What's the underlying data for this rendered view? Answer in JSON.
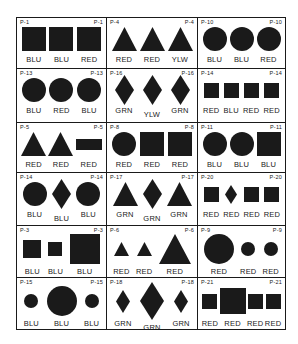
{
  "cells": [
    {
      "id": "P-1",
      "items": [
        {
          "shape": "square",
          "size": "l",
          "color": "BLU"
        },
        {
          "shape": "square",
          "size": "l",
          "color": "BLU"
        },
        {
          "shape": "square",
          "size": "l",
          "color": "RED"
        }
      ]
    },
    {
      "id": "P-4",
      "items": [
        {
          "shape": "triangle",
          "size": "l",
          "color": "RED"
        },
        {
          "shape": "triangle",
          "size": "l",
          "color": "RED"
        },
        {
          "shape": "triangle",
          "size": "l",
          "color": "YLW"
        }
      ]
    },
    {
      "id": "P-10",
      "items": [
        {
          "shape": "circle",
          "size": "l",
          "color": "BLU"
        },
        {
          "shape": "circle",
          "size": "l",
          "color": "BLU"
        },
        {
          "shape": "circle",
          "size": "l",
          "color": "RED"
        }
      ]
    },
    {
      "id": "P-13",
      "items": [
        {
          "shape": "circle",
          "size": "l",
          "color": "BLU"
        },
        {
          "shape": "circle",
          "size": "l",
          "color": "RED"
        },
        {
          "shape": "circle",
          "size": "l",
          "color": "BLU"
        }
      ]
    },
    {
      "id": "P-16",
      "items": [
        {
          "shape": "diamond",
          "size": "l",
          "color": "GRN"
        },
        {
          "shape": "diamond",
          "size": "l",
          "color": "YLW"
        },
        {
          "shape": "diamond",
          "size": "l",
          "color": "GRN"
        }
      ]
    },
    {
      "id": "P-14",
      "items": [
        {
          "shape": "square",
          "size": "s",
          "color": "RED"
        },
        {
          "shape": "square",
          "size": "s",
          "color": "BLU"
        },
        {
          "shape": "square",
          "size": "s",
          "color": "RED"
        },
        {
          "shape": "square",
          "size": "s",
          "color": "RED"
        }
      ]
    },
    {
      "id": "P-5",
      "items": [
        {
          "shape": "triangle",
          "size": "l",
          "color": "RED"
        },
        {
          "shape": "triangle",
          "size": "l",
          "color": "RED"
        },
        {
          "shape": "rectangle",
          "size": "l",
          "color": "RED"
        }
      ]
    },
    {
      "id": "P-8",
      "items": [
        {
          "shape": "circle",
          "size": "l",
          "color": "RED"
        },
        {
          "shape": "square",
          "size": "l",
          "color": "RED"
        },
        {
          "shape": "square",
          "size": "l",
          "color": "RED"
        }
      ]
    },
    {
      "id": "P-11",
      "items": [
        {
          "shape": "circle",
          "size": "l",
          "color": "BLU"
        },
        {
          "shape": "circle",
          "size": "l",
          "color": "BLU"
        },
        {
          "shape": "square",
          "size": "l",
          "color": "BLU"
        }
      ]
    },
    {
      "id": "P-14",
      "items": [
        {
          "shape": "circle",
          "size": "l",
          "color": "BLU"
        },
        {
          "shape": "diamond",
          "size": "l",
          "color": "BLU"
        },
        {
          "shape": "circle",
          "size": "l",
          "color": "BLU"
        }
      ]
    },
    {
      "id": "P-17",
      "items": [
        {
          "shape": "triangle",
          "size": "l",
          "color": "GRN"
        },
        {
          "shape": "diamond",
          "size": "l",
          "color": "GRN"
        },
        {
          "shape": "triangle",
          "size": "l",
          "color": "GRN"
        }
      ]
    },
    {
      "id": "P-20",
      "items": [
        {
          "shape": "square",
          "size": "s",
          "color": "RED"
        },
        {
          "shape": "diamond",
          "size": "s",
          "color": "RED"
        },
        {
          "shape": "square",
          "size": "s",
          "color": "RED"
        },
        {
          "shape": "square",
          "size": "s",
          "color": "RED"
        }
      ]
    },
    {
      "id": "P-3",
      "items": [
        {
          "shape": "square",
          "size": "m",
          "color": "BLU"
        },
        {
          "shape": "square",
          "size": "s",
          "color": "BLU"
        },
        {
          "shape": "square",
          "size": "xl",
          "color": "BLU"
        }
      ]
    },
    {
      "id": "P-6",
      "items": [
        {
          "shape": "triangle",
          "size": "s",
          "color": "RED"
        },
        {
          "shape": "triangle",
          "size": "s",
          "color": "RED"
        },
        {
          "shape": "triangle",
          "size": "xl",
          "color": "RED"
        }
      ]
    },
    {
      "id": "P-9",
      "items": [
        {
          "shape": "circle",
          "size": "xl",
          "color": "RED"
        },
        {
          "shape": "circle",
          "size": "s",
          "color": "RED"
        },
        {
          "shape": "circle",
          "size": "s",
          "color": "RED"
        }
      ]
    },
    {
      "id": "P-15",
      "items": [
        {
          "shape": "circle",
          "size": "s",
          "color": "BLU"
        },
        {
          "shape": "circle",
          "size": "xl",
          "color": "BLU"
        },
        {
          "shape": "circle",
          "size": "s",
          "color": "BLU"
        }
      ]
    },
    {
      "id": "P-18",
      "items": [
        {
          "shape": "diamond",
          "size": "m",
          "color": "GRN"
        },
        {
          "shape": "diamond",
          "size": "xl",
          "color": "GRN"
        },
        {
          "shape": "diamond",
          "size": "m",
          "color": "GRN"
        }
      ]
    },
    {
      "id": "P-21",
      "items": [
        {
          "shape": "square",
          "size": "s",
          "color": "RED"
        },
        {
          "shape": "square",
          "size": "xl",
          "color": "RED"
        },
        {
          "shape": "square",
          "size": "s",
          "color": "RED"
        },
        {
          "shape": "square",
          "size": "s",
          "color": "RED"
        }
      ]
    }
  ]
}
